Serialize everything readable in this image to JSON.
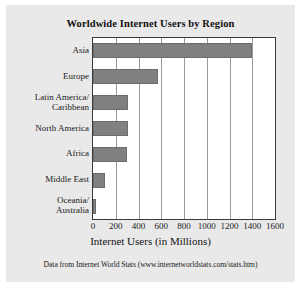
{
  "chart_data": {
    "type": "bar",
    "orientation": "horizontal",
    "title": "Worldwide Internet Users by Region",
    "xlabel": "Internet Users (in Millions)",
    "ylabel": "",
    "categories": [
      "Asia",
      "Europe",
      "Latin America/\nCaribbean",
      "North America",
      "Africa",
      "Middle East",
      "Oceania/\nAustralia"
    ],
    "values": [
      1400,
      570,
      305,
      305,
      300,
      105,
      25
    ],
    "xlim": [
      0,
      1600
    ],
    "ylim": [
      0,
      7
    ],
    "xticks": [
      0,
      200,
      400,
      600,
      800,
      1000,
      1200,
      1400,
      1600
    ],
    "xtick_labels": [
      "0",
      "200",
      "400",
      "600",
      "800",
      "1000",
      "1200",
      "1400",
      "1600"
    ],
    "grid": "vertical",
    "legend": "none",
    "bar_color": "#808080",
    "plot_background": "#ffffff",
    "figure_background": "#e9e9e9",
    "source_note": "Data from Internet World Stats (www.internetworldstats.com/stats.htm)"
  },
  "axis_label_lines": [
    [
      "Asia"
    ],
    [
      "Europe"
    ],
    [
      "Latin America/",
      "Caribbean"
    ],
    [
      "North America"
    ],
    [
      "Africa"
    ],
    [
      "Middle East"
    ],
    [
      "Oceania/",
      "Australia"
    ]
  ]
}
